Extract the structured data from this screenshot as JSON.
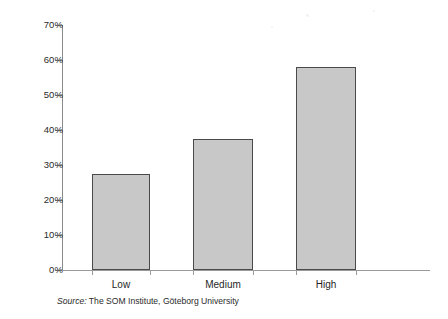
{
  "chart_data": {
    "type": "bar",
    "title": "",
    "subtitle": "",
    "xlabel": "",
    "ylabel": "",
    "categories": [
      "Low",
      "Medium",
      "High"
    ],
    "values": [
      27.5,
      37.5,
      58
    ],
    "value_unit": "%",
    "ylim": [
      0,
      70
    ],
    "y_ticks": [
      0,
      10,
      20,
      30,
      40,
      50,
      60,
      70
    ],
    "y_tick_labels": [
      "0%",
      "10%",
      "20%",
      "30%",
      "40%",
      "50%",
      "60%",
      "70%"
    ],
    "grid": false,
    "legend": null,
    "legend_position": "none",
    "series": [
      {
        "name": "",
        "values": [
          27.5,
          37.5,
          58
        ]
      }
    ],
    "bar_fill_color": "#c8c8c8",
    "bar_border_color": "#4a4a4a",
    "axis_color": "#8a8a8a",
    "background_color": "#ffffff"
  },
  "source": {
    "lead": "Source:",
    "text": "The SOM Institute, Göteborg University"
  }
}
